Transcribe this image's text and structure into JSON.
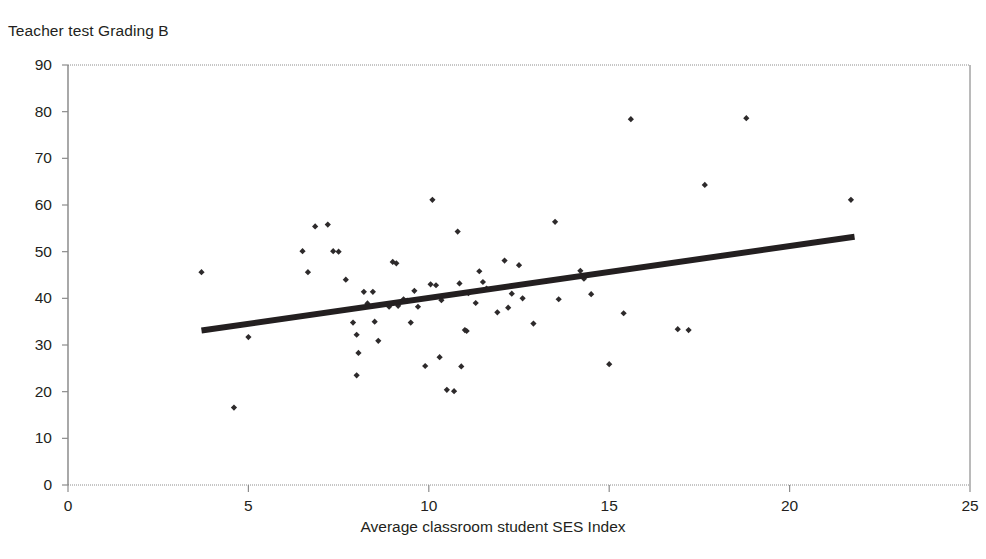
{
  "figure": {
    "title": "Teacher test Grading B",
    "xlabel": "Average classroom student SES Index",
    "ylabel": ""
  },
  "axes": {
    "x_ticks": [
      "0",
      "5",
      "10",
      "15",
      "20",
      "25"
    ],
    "y_ticks": [
      "0",
      "10",
      "20",
      "30",
      "40",
      "50",
      "60",
      "70",
      "80",
      "90"
    ]
  },
  "colors": {
    "point": "#2d2a2b",
    "trendline": "#231f20",
    "axis": "#8c8c8c",
    "text": "#231f20",
    "background": "#ffffff"
  },
  "chart_data": {
    "type": "scatter",
    "title": "Teacher test Grading B",
    "xlabel": "Average classroom student SES Index",
    "ylabel": "",
    "xlim": [
      0,
      25
    ],
    "ylim": [
      0,
      90
    ],
    "xticks": [
      0,
      5,
      10,
      15,
      20,
      25
    ],
    "yticks": [
      0,
      10,
      20,
      30,
      40,
      50,
      60,
      70,
      80,
      90
    ],
    "grid": false,
    "legend": false,
    "series": [
      {
        "name": "Classrooms",
        "marker": "diamond",
        "points": [
          [
            3.7,
            45.6
          ],
          [
            4.6,
            16.6
          ],
          [
            5.0,
            31.7
          ],
          [
            6.5,
            50.1
          ],
          [
            6.65,
            45.6
          ],
          [
            6.85,
            55.4
          ],
          [
            7.2,
            55.8
          ],
          [
            7.35,
            50.1
          ],
          [
            7.5,
            50.0
          ],
          [
            7.7,
            44.0
          ],
          [
            7.9,
            34.8
          ],
          [
            8.0,
            32.2
          ],
          [
            8.05,
            28.3
          ],
          [
            8.0,
            23.5
          ],
          [
            8.2,
            41.4
          ],
          [
            8.3,
            38.9
          ],
          [
            8.45,
            41.4
          ],
          [
            8.5,
            35.0
          ],
          [
            8.6,
            30.9
          ],
          [
            8.9,
            38.2
          ],
          [
            9.0,
            47.8
          ],
          [
            9.1,
            47.5
          ],
          [
            9.15,
            38.4
          ],
          [
            9.3,
            39.8
          ],
          [
            9.4,
            39.5
          ],
          [
            9.5,
            34.8
          ],
          [
            9.6,
            41.6
          ],
          [
            9.7,
            38.2
          ],
          [
            9.9,
            25.5
          ],
          [
            10.05,
            43.0
          ],
          [
            10.1,
            61.1
          ],
          [
            10.2,
            42.8
          ],
          [
            10.3,
            27.4
          ],
          [
            10.35,
            39.6
          ],
          [
            10.5,
            20.4
          ],
          [
            10.7,
            20.1
          ],
          [
            10.8,
            54.3
          ],
          [
            10.85,
            43.2
          ],
          [
            10.9,
            25.4
          ],
          [
            11.0,
            33.2
          ],
          [
            11.05,
            33.0
          ],
          [
            11.1,
            41.1
          ],
          [
            11.3,
            39.0
          ],
          [
            11.4,
            45.8
          ],
          [
            11.5,
            43.5
          ],
          [
            11.6,
            42.1
          ],
          [
            11.9,
            37.0
          ],
          [
            12.1,
            48.1
          ],
          [
            12.2,
            38.0
          ],
          [
            12.3,
            41.0
          ],
          [
            12.5,
            47.1
          ],
          [
            12.6,
            40.0
          ],
          [
            12.9,
            34.6
          ],
          [
            13.5,
            56.4
          ],
          [
            13.6,
            39.8
          ],
          [
            14.2,
            45.9
          ],
          [
            14.3,
            44.2
          ],
          [
            14.5,
            40.9
          ],
          [
            15.0,
            25.9
          ],
          [
            15.4,
            36.8
          ],
          [
            15.6,
            78.4
          ],
          [
            16.9,
            33.4
          ],
          [
            17.2,
            33.2
          ],
          [
            17.65,
            64.3
          ],
          [
            18.8,
            78.6
          ],
          [
            21.7,
            61.1
          ]
        ]
      }
    ],
    "trendline": {
      "type": "linear",
      "x_start": 3.7,
      "y_start": 33.1,
      "x_end": 21.8,
      "y_end": 53.2,
      "slope": 1.11,
      "intercept": 29.0
    }
  }
}
